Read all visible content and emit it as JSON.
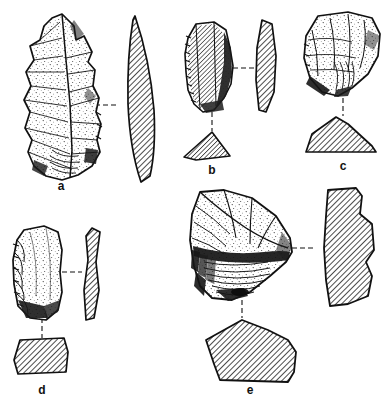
{
  "plate": {
    "kind": "archaeological-lithic-illustration-plate",
    "background_color": "#ffffff",
    "ink_color": "#111111",
    "width": 387,
    "height": 404,
    "description": "Line-drawing plate of five stone tools, each shown as a stippled face view with hatched profile and/or cross-section joined by dashed leader lines.",
    "specimens": [
      {
        "id": "a",
        "label": "a",
        "label_x": 61,
        "label_y": 185,
        "views": [
          "face",
          "profile"
        ],
        "leader": "horizontal-dashed"
      },
      {
        "id": "b",
        "label": "b",
        "label_x": 212,
        "label_y": 169,
        "views": [
          "face",
          "profile",
          "cross-section"
        ],
        "leader": "horizontal-dashed-and-vertical-dashed"
      },
      {
        "id": "c",
        "label": "c",
        "label_x": 343,
        "label_y": 165,
        "views": [
          "face",
          "cross-section"
        ],
        "leader": "vertical-dashed"
      },
      {
        "id": "d",
        "label": "d",
        "label_x": 42,
        "label_y": 389,
        "views": [
          "face",
          "profile",
          "cross-section"
        ],
        "leader": "horizontal-dashed-and-vertical-dashed"
      },
      {
        "id": "e",
        "label": "e",
        "label_x": 250,
        "label_y": 389,
        "views": [
          "face",
          "profile",
          "cross-section"
        ],
        "leader": "horizontal-dashed-and-vertical-dashed"
      }
    ]
  }
}
